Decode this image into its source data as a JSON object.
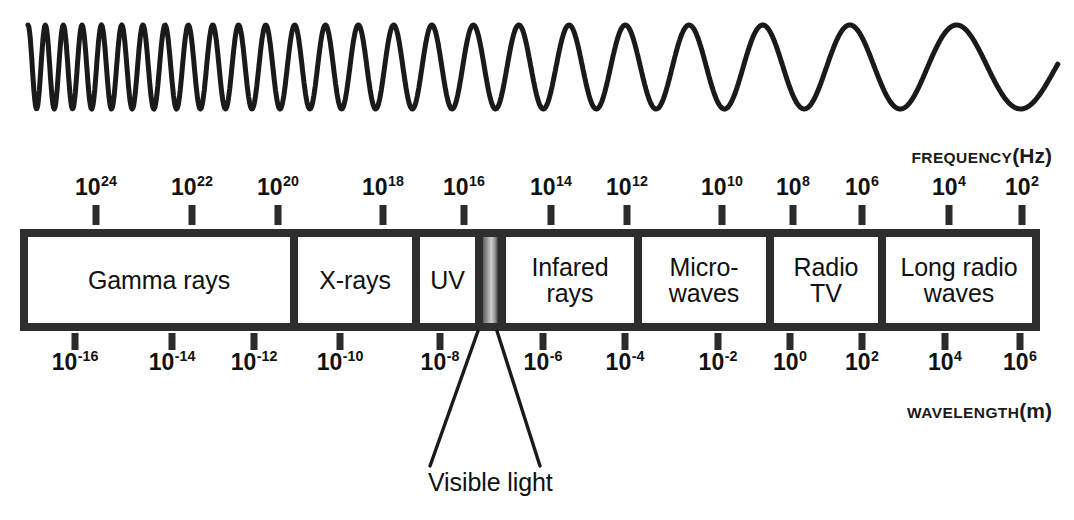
{
  "figure": {
    "background_color": "#ffffff",
    "ink_color": "#2e2e2e"
  },
  "wave": {
    "name": "electromagnetic-wave",
    "description": "Sine wave whose wavelength increases from left to right",
    "stroke_color": "#1a1a1a"
  },
  "frequency_axis": {
    "caption_word": "FREQUENCY",
    "caption_unit": "(Hz)",
    "ticks": [
      {
        "mantissa": "10",
        "exponent": "24",
        "x": 96
      },
      {
        "mantissa": "10",
        "exponent": "22",
        "x": 192
      },
      {
        "mantissa": "10",
        "exponent": "20",
        "x": 278
      },
      {
        "mantissa": "10",
        "exponent": "18",
        "x": 383
      },
      {
        "mantissa": "10",
        "exponent": "16",
        "x": 464
      },
      {
        "mantissa": "10",
        "exponent": "14",
        "x": 551
      },
      {
        "mantissa": "10",
        "exponent": "12",
        "x": 627
      },
      {
        "mantissa": "10",
        "exponent": "10",
        "x": 722
      },
      {
        "mantissa": "10",
        "exponent": "8",
        "x": 793
      },
      {
        "mantissa": "10",
        "exponent": "6",
        "x": 862
      },
      {
        "mantissa": "10",
        "exponent": "4",
        "x": 949
      },
      {
        "mantissa": "10",
        "exponent": "2",
        "x": 1022
      }
    ]
  },
  "wavelength_axis": {
    "caption_word": "WAVELENGTH",
    "caption_unit": "(m)",
    "ticks": [
      {
        "mantissa": "10",
        "exponent": "-16",
        "x": 75
      },
      {
        "mantissa": "10",
        "exponent": "-14",
        "x": 172
      },
      {
        "mantissa": "10",
        "exponent": "-12",
        "x": 254
      },
      {
        "mantissa": "10",
        "exponent": "-10",
        "x": 340
      },
      {
        "mantissa": "10",
        "exponent": "-8",
        "x": 440
      },
      {
        "mantissa": "10",
        "exponent": "-6",
        "x": 543
      },
      {
        "mantissa": "10",
        "exponent": "-4",
        "x": 625
      },
      {
        "mantissa": "10",
        "exponent": "-2",
        "x": 718
      },
      {
        "mantissa": "10",
        "exponent": "0",
        "x": 790
      },
      {
        "mantissa": "10",
        "exponent": "2",
        "x": 862
      },
      {
        "mantissa": "10",
        "exponent": "4",
        "x": 945
      },
      {
        "mantissa": "10",
        "exponent": "6",
        "x": 1020
      }
    ]
  },
  "spectrum_bands": [
    {
      "name": "gamma-rays",
      "label": "Gamma rays",
      "left": 0,
      "width": 262,
      "kind": "plain"
    },
    {
      "name": "x-rays",
      "label": "X-rays",
      "left": 262,
      "width": 122,
      "kind": "plain"
    },
    {
      "name": "ultraviolet",
      "label": "UV",
      "left": 384,
      "width": 63,
      "kind": "plain"
    },
    {
      "name": "visible-light",
      "label": "",
      "left": 447,
      "width": 23,
      "kind": "gradient"
    },
    {
      "name": "infrared-rays",
      "label": "Infared\nrays",
      "left": 470,
      "width": 136,
      "kind": "plain"
    },
    {
      "name": "microwaves",
      "label": "Micro-\nwaves",
      "left": 606,
      "width": 132,
      "kind": "plain"
    },
    {
      "name": "radio-tv",
      "label": "Radio\nTV",
      "left": 738,
      "width": 112,
      "kind": "plain"
    },
    {
      "name": "long-radio-waves",
      "label": "Long radio\nwaves",
      "left": 850,
      "width": 154,
      "kind": "plain"
    }
  ],
  "callout": {
    "label": "Visible light",
    "leader_left": {
      "x1": 478,
      "y1": 331,
      "x2": 430,
      "y2": 466
    },
    "leader_right": {
      "x1": 497,
      "y1": 331,
      "x2": 540,
      "y2": 466
    }
  },
  "chart_data": {
    "type": "bar",
    "xlabel_top": "FREQUENCY (Hz)",
    "xlabel_bottom": "WAVELENGTH (m)",
    "grid": false,
    "legend": "none",
    "frequency_tick_values_hz": [
      "1e24",
      "1e22",
      "1e20",
      "1e18",
      "1e16",
      "1e14",
      "1e12",
      "1e10",
      "1e8",
      "1e6",
      "1e4",
      "1e2"
    ],
    "wavelength_tick_values_m": [
      "1e-16",
      "1e-14",
      "1e-12",
      "1e-10",
      "1e-8",
      "1e-6",
      "1e-4",
      "1e-2",
      "1e0",
      "1e2",
      "1e4",
      "1e6"
    ],
    "categories": [
      "Gamma rays",
      "X-rays",
      "UV",
      "Visible light",
      "Infared rays",
      "Micro-waves",
      "Radio TV",
      "Long radio waves"
    ],
    "annotations": [
      "Visible light"
    ]
  }
}
